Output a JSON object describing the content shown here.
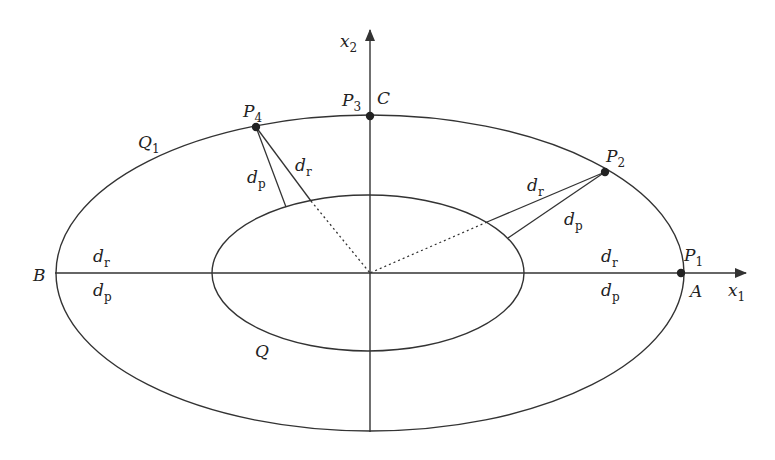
{
  "diagram": {
    "type": "geometry",
    "colors": {
      "stroke": "#333333",
      "text": "#222222",
      "background": "#ffffff"
    },
    "axes": {
      "x1": {
        "label": "x",
        "sub": "1"
      },
      "x2": {
        "label": "x",
        "sub": "2"
      }
    },
    "curves": {
      "outer": {
        "label": "Q",
        "sub": "1"
      },
      "inner": {
        "label": "Q",
        "sub": ""
      }
    },
    "points": [
      {
        "id": "P1",
        "label": "P",
        "sub": "1",
        "alias": "A"
      },
      {
        "id": "P2",
        "label": "P",
        "sub": "2"
      },
      {
        "id": "P3",
        "label": "P",
        "sub": "3",
        "alias": "C"
      },
      {
        "id": "P4",
        "label": "P",
        "sub": "4"
      }
    ],
    "vertex_labels": {
      "A": "A",
      "B": "B",
      "C": "C"
    },
    "distance_labels": {
      "dr": {
        "label": "d",
        "sub": "r"
      },
      "dp": {
        "label": "d",
        "sub": "p"
      }
    }
  }
}
